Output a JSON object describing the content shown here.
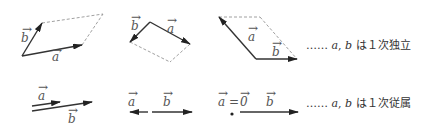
{
  "colors": {
    "stroke": "#333333",
    "dashed": "#888888",
    "label": "#555555"
  },
  "labels": {
    "a": "a",
    "b": "b",
    "zero": "0",
    "equals": "=",
    "arrow": "→"
  },
  "rows": [
    {
      "name": "independent",
      "caption_dots": "……",
      "caption_vec_a": "a",
      "caption_sep": ",",
      "caption_vec_b": "b",
      "caption_text": "は１次独立",
      "figures": [
        {
          "name": "parallelogram-1",
          "origin": [
            22,
            56
          ],
          "a_end": [
            82,
            45
          ],
          "b_end": [
            42,
            23
          ],
          "corner": [
            103,
            14
          ]
        },
        {
          "name": "parallelogram-2",
          "origin": [
            150,
            22
          ],
          "a_end": [
            190,
            44
          ],
          "b_end": [
            130,
            42
          ],
          "corner": [
            170,
            62
          ]
        },
        {
          "name": "parallelogram-3",
          "origin": [
            256,
            59
          ],
          "a_end": [
            219,
            17
          ],
          "b_end": [
            297,
            59
          ],
          "corner": [
            260,
            17
          ]
        }
      ]
    },
    {
      "name": "dependent",
      "caption_dots": "……",
      "caption_vec_a": "a",
      "caption_sep": ",",
      "caption_vec_b": "b",
      "caption_text": "は１次従属",
      "figures": [
        {
          "name": "parallel-same-direction",
          "a": [
            [
              32,
              106
            ],
            [
              60,
              102
            ]
          ],
          "b": [
            [
              32,
              111
            ],
            [
              92,
              102
            ]
          ]
        },
        {
          "name": "opposite-direction",
          "origin": [
            151,
            112
          ],
          "a_end": [
            130,
            112
          ],
          "b_end": [
            192,
            112
          ]
        },
        {
          "name": "a-is-zero",
          "dot": [
            232,
            113
          ],
          "b": [
            [
              240,
              112
            ],
            [
              298,
              112
            ]
          ]
        }
      ]
    }
  ]
}
